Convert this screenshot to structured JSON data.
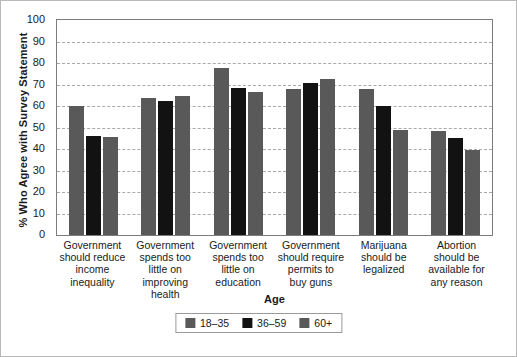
{
  "chart_data": {
    "type": "bar",
    "title": "",
    "xlabel": "Age",
    "ylabel": "% Who Agree with Survey Statement",
    "ylim": [
      0,
      100
    ],
    "yticks": [
      0,
      10,
      20,
      30,
      40,
      50,
      60,
      70,
      80,
      90,
      100
    ],
    "grid": true,
    "legend_position": "bottom",
    "categories": [
      "Government should reduce income inequality",
      "Government spends too little on improving health",
      "Government spends too little on education",
      "Government should require permits to buy guns",
      "Marijuana should be legalized",
      "Abortion should be available for any reason"
    ],
    "category_lines": [
      [
        "Government",
        "should reduce",
        "income",
        "inequality"
      ],
      [
        "Government",
        "spends too",
        "little on",
        "improving",
        "health"
      ],
      [
        "Government",
        "spends too",
        "little on",
        "education"
      ],
      [
        "Government",
        "should require",
        "permits to",
        "buy guns"
      ],
      [
        "Marijuana",
        "should be",
        "legalized"
      ],
      [
        "Abortion",
        "should be",
        "available for",
        "any reason"
      ]
    ],
    "series": [
      {
        "name": "18–35",
        "color": "#595959",
        "values": [
          60.0,
          63.5,
          77.5,
          68.0,
          68.0,
          48.5
        ]
      },
      {
        "name": "36–59",
        "color": "#121212",
        "values": [
          46.0,
          62.5,
          68.5,
          70.5,
          60.0,
          45.0
        ]
      },
      {
        "name": "60+",
        "color": "#595959",
        "values": [
          45.5,
          64.5,
          66.5,
          72.5,
          49.0,
          39.5
        ]
      }
    ]
  },
  "legend": {
    "items": [
      {
        "label": "18–35",
        "color": "#595959"
      },
      {
        "label": "36–59",
        "color": "#121212"
      },
      {
        "label": "60+",
        "color": "#595959"
      }
    ]
  },
  "colors": {
    "gray_bar": "#595959",
    "black_bar": "#121212",
    "gridline": "#a9a9a9",
    "axis": "#7c7c7c",
    "frame": "#b9b9b9",
    "background": "#ffffff"
  }
}
